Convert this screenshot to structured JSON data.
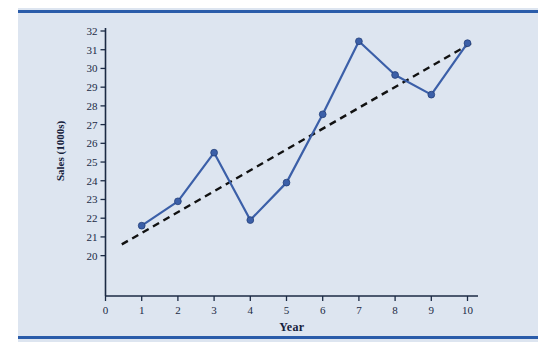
{
  "figure": {
    "background_color": "#dde5f0",
    "rule_color": "#2a5caa",
    "series_color": "#3b5fa8",
    "trend_color": "#111111"
  },
  "chart_data": {
    "type": "line",
    "title": "",
    "xlabel": "Year",
    "ylabel": "Sales (1000s)",
    "xlim": [
      0,
      10.45
    ],
    "ylim": [
      19.2,
      32
    ],
    "grid": false,
    "legend": "none",
    "x": [
      1,
      2,
      3,
      4,
      5,
      6,
      7,
      8,
      9,
      10
    ],
    "xticks": [
      0,
      1,
      2,
      3,
      4,
      5,
      6,
      7,
      8,
      9,
      10
    ],
    "xtick_labels": [
      "0",
      "1",
      "2",
      "3",
      "4",
      "5",
      "6",
      "7",
      "8",
      "9",
      "10"
    ],
    "yticks": [
      20,
      21,
      22,
      23,
      24,
      25,
      26,
      27,
      28,
      29,
      30,
      31,
      32
    ],
    "ytick_labels": [
      "20",
      "21",
      "22",
      "23",
      "24",
      "25",
      "26",
      "27",
      "28",
      "29",
      "30",
      "31",
      "32"
    ],
    "series": [
      {
        "name": "Sales",
        "style": "solid-with-markers",
        "color": "#3b5fa8",
        "values": [
          21.6,
          22.9,
          25.5,
          21.9,
          23.9,
          27.55,
          31.45,
          29.65,
          28.6,
          31.35
        ]
      },
      {
        "name": "Trend line",
        "style": "dashed",
        "color": "#111111",
        "x_endpoints": [
          0.45,
          10.1
        ],
        "y_endpoints": [
          20.6,
          31.35
        ]
      }
    ]
  }
}
